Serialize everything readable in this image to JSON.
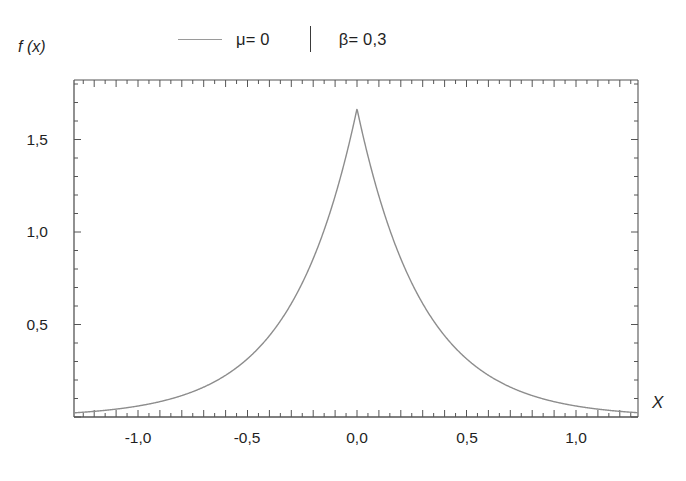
{
  "figure": {
    "background": "#ffffff",
    "frame_color": "#555555",
    "curve_color": "#8d8d8d"
  },
  "legend": {
    "series_label": "μ= 0",
    "param_label": "β= 0,3",
    "divider": "|"
  },
  "axes": {
    "ylabel": "f (x)",
    "xlabel": "X"
  },
  "chart_data": {
    "type": "line",
    "title": "",
    "subtitle": "",
    "xlabel": "X",
    "ylabel": "f (x)",
    "xlim": [
      -1.29,
      1.28
    ],
    "ylim": [
      0.0,
      1.82
    ],
    "xticks": [
      -1.0,
      -0.5,
      0.0,
      0.5,
      1.0
    ],
    "xticklabels": [
      "-1,0",
      "-0,5",
      "0,0",
      "0,5",
      "1,0"
    ],
    "yticks": [
      0.5,
      1.0,
      1.5
    ],
    "yticklabels": [
      "0,5",
      "1,0",
      "1,5"
    ],
    "minor_tick_step_x": 0.05,
    "minor_tick_step_y": 0.1,
    "grid": false,
    "legend_position": "top-center",
    "distribution": "laplace",
    "parameters": {
      "mu": 0,
      "beta": 0.3
    },
    "peak_value": 1.667,
    "series": [
      {
        "name": "μ= 0  |  β= 0,3",
        "color": "#8d8d8d",
        "x": [
          -1.29,
          -1.2,
          -1.1,
          -1.0,
          -0.9,
          -0.8,
          -0.7,
          -0.6,
          -0.5,
          -0.45,
          -0.4,
          -0.35,
          -0.3,
          -0.25,
          -0.2,
          -0.15,
          -0.1,
          -0.05,
          0.0,
          0.05,
          0.1,
          0.15,
          0.2,
          0.25,
          0.3,
          0.35,
          0.4,
          0.45,
          0.5,
          0.6,
          0.7,
          0.8,
          0.9,
          1.0,
          1.1,
          1.2,
          1.28
        ],
        "y": [
          0.0251,
          0.0305,
          0.0437,
          0.0597,
          0.0833,
          0.1163,
          0.1623,
          0.2265,
          0.3161,
          0.3736,
          0.4415,
          0.5218,
          0.6166,
          0.7287,
          0.8612,
          1.0178,
          1.2028,
          1.4214,
          1.6667,
          1.4214,
          1.2028,
          1.0178,
          0.8612,
          0.7287,
          0.6166,
          0.5218,
          0.4415,
          0.3736,
          0.3161,
          0.2265,
          0.1623,
          0.1163,
          0.0833,
          0.0597,
          0.0437,
          0.0305,
          0.0251
        ]
      }
    ]
  }
}
